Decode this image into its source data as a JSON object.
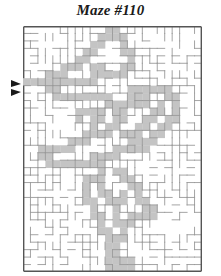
{
  "title": "Maze #110",
  "maze": {
    "cols": 24,
    "rows": 33,
    "cell_size": 7.45,
    "colors": {
      "border": "#555555",
      "wall": "#9a9a9a",
      "solution_fill": "#c4c4c4",
      "background": "#ffffff",
      "arrow": "#1a1a1a"
    },
    "entry": {
      "side": "left",
      "row": 7,
      "icon": "double-triangle-arrow"
    },
    "solution_path": [
      [
        0,
        7
      ],
      [
        1,
        7
      ],
      [
        2,
        7
      ],
      [
        3,
        7
      ],
      [
        3,
        6
      ],
      [
        4,
        6
      ],
      [
        5,
        6
      ],
      [
        5,
        5
      ],
      [
        6,
        5
      ],
      [
        7,
        5
      ],
      [
        7,
        4
      ],
      [
        8,
        4
      ],
      [
        8,
        3
      ],
      [
        9,
        3
      ],
      [
        9,
        2
      ],
      [
        10,
        2
      ],
      [
        10,
        1
      ],
      [
        11,
        1
      ],
      [
        11,
        0
      ],
      [
        12,
        0
      ],
      [
        12,
        1
      ],
      [
        13,
        1
      ],
      [
        13,
        2
      ],
      [
        13,
        3
      ],
      [
        14,
        3
      ],
      [
        14,
        4
      ],
      [
        14,
        5
      ],
      [
        13,
        5
      ],
      [
        13,
        6
      ],
      [
        12,
        6
      ],
      [
        11,
        6
      ],
      [
        10,
        6
      ],
      [
        10,
        5
      ],
      [
        9,
        5
      ],
      [
        9,
        6
      ],
      [
        9,
        7
      ],
      [
        8,
        7
      ],
      [
        7,
        7
      ],
      [
        6,
        7
      ],
      [
        5,
        7
      ],
      [
        4,
        7
      ],
      [
        3,
        8
      ],
      [
        4,
        8
      ],
      [
        4,
        9
      ],
      [
        5,
        9
      ],
      [
        6,
        9
      ],
      [
        7,
        9
      ],
      [
        8,
        9
      ],
      [
        9,
        9
      ],
      [
        10,
        9
      ],
      [
        11,
        9
      ],
      [
        11,
        10
      ],
      [
        12,
        10
      ],
      [
        13,
        10
      ],
      [
        14,
        10
      ],
      [
        15,
        10
      ],
      [
        16,
        10
      ],
      [
        16,
        9
      ],
      [
        15,
        9
      ],
      [
        14,
        9
      ],
      [
        14,
        8
      ],
      [
        15,
        8
      ],
      [
        16,
        8
      ],
      [
        17,
        8
      ],
      [
        18,
        8
      ],
      [
        19,
        8
      ],
      [
        19,
        9
      ],
      [
        20,
        9
      ],
      [
        20,
        10
      ],
      [
        20,
        11
      ],
      [
        20,
        12
      ],
      [
        19,
        12
      ],
      [
        19,
        13
      ],
      [
        18,
        13
      ],
      [
        18,
        14
      ],
      [
        17,
        14
      ],
      [
        17,
        15
      ],
      [
        16,
        15
      ],
      [
        16,
        16
      ],
      [
        15,
        16
      ],
      [
        14,
        16
      ],
      [
        13,
        16
      ],
      [
        12,
        16
      ],
      [
        12,
        17
      ],
      [
        11,
        17
      ],
      [
        10,
        17
      ],
      [
        9,
        17
      ],
      [
        9,
        18
      ],
      [
        8,
        18
      ],
      [
        7,
        18
      ],
      [
        6,
        18
      ],
      [
        5,
        18
      ],
      [
        4,
        18
      ],
      [
        3,
        18
      ],
      [
        3,
        17
      ],
      [
        2,
        17
      ],
      [
        2,
        16
      ],
      [
        3,
        16
      ],
      [
        4,
        16
      ],
      [
        5,
        16
      ],
      [
        6,
        16
      ],
      [
        6,
        15
      ],
      [
        7,
        15
      ],
      [
        8,
        15
      ],
      [
        8,
        14
      ],
      [
        9,
        14
      ],
      [
        10,
        14
      ],
      [
        11,
        14
      ],
      [
        11,
        13
      ],
      [
        12,
        13
      ],
      [
        12,
        12
      ],
      [
        13,
        12
      ],
      [
        13,
        11
      ],
      [
        10,
        12
      ],
      [
        10,
        11
      ],
      [
        9,
        11
      ],
      [
        8,
        11
      ],
      [
        7,
        11
      ],
      [
        7,
        12
      ],
      [
        10,
        18
      ],
      [
        10,
        19
      ],
      [
        10,
        20
      ],
      [
        9,
        20
      ],
      [
        8,
        20
      ],
      [
        8,
        21
      ],
      [
        8,
        22
      ],
      [
        8,
        23
      ],
      [
        9,
        23
      ],
      [
        9,
        24
      ],
      [
        9,
        25
      ],
      [
        10,
        25
      ],
      [
        10,
        26
      ],
      [
        10,
        27
      ],
      [
        11,
        27
      ],
      [
        11,
        28
      ],
      [
        11,
        29
      ],
      [
        11,
        30
      ],
      [
        11,
        31
      ],
      [
        11,
        32
      ],
      [
        12,
        19
      ],
      [
        13,
        19
      ],
      [
        13,
        20
      ],
      [
        14,
        20
      ],
      [
        14,
        21
      ],
      [
        15,
        21
      ],
      [
        15,
        22
      ],
      [
        15,
        23
      ],
      [
        16,
        23
      ],
      [
        16,
        24
      ],
      [
        17,
        24
      ],
      [
        17,
        25
      ],
      [
        16,
        25
      ],
      [
        15,
        25
      ],
      [
        14,
        25
      ],
      [
        14,
        26
      ],
      [
        13,
        26
      ],
      [
        13,
        27
      ],
      [
        13,
        28
      ],
      [
        12,
        28
      ],
      [
        12,
        29
      ],
      [
        12,
        30
      ],
      [
        12,
        31
      ],
      [
        13,
        31
      ],
      [
        14,
        31
      ],
      [
        14,
        32
      ],
      [
        13,
        32
      ],
      [
        12,
        32
      ],
      [
        9,
        13
      ],
      [
        9,
        12
      ],
      [
        12,
        11
      ],
      [
        13,
        14
      ],
      [
        14,
        14
      ],
      [
        15,
        14
      ],
      [
        15,
        13
      ],
      [
        16,
        13
      ],
      [
        16,
        12
      ],
      [
        17,
        12
      ],
      [
        17,
        11
      ],
      [
        18,
        11
      ],
      [
        18,
        10
      ],
      [
        14,
        15
      ],
      [
        15,
        15
      ],
      [
        12,
        24
      ],
      [
        12,
        23
      ],
      [
        11,
        23
      ],
      [
        11,
        22
      ],
      [
        10,
        22
      ],
      [
        10,
        21
      ],
      [
        13,
        22
      ],
      [
        13,
        23
      ],
      [
        12,
        25
      ],
      [
        12,
        26
      ]
    ]
  }
}
